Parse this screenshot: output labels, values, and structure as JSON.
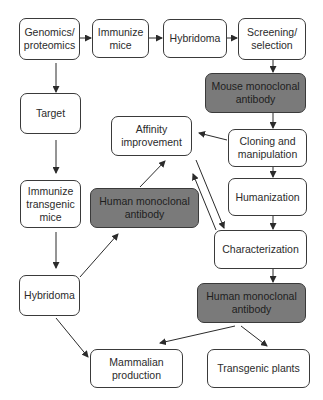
{
  "diagram": {
    "type": "flowchart",
    "colors": {
      "node_fill": "#ffffff",
      "highlight_fill": "#7a7a7a",
      "stroke": "#3a3a3a",
      "text": "#2b2b2b"
    },
    "nodes": {
      "genomics": "Genomics/ proteomics",
      "immunize_mice": "Immunize mice",
      "hybridoma_top": "Hybridoma",
      "screening": "Screening/ selection",
      "mouse_mab": "Mouse monoclonal antibody",
      "target": "Target",
      "affinity": "Affinity improvement",
      "cloning": "Cloning and manipulation",
      "immunize_transgenic": "Immunize transgenic mice",
      "human_mab_mid": "Human monoclonal antibody",
      "humanization": "Humanization",
      "characterization": "Characterization",
      "hybridoma_left": "Hybridoma",
      "human_mab_bottom": "Human monoclonal antibody",
      "mammalian": "Mammalian production",
      "plants": "Transgenic plants"
    },
    "edges": [
      [
        "genomics",
        "immunize_mice"
      ],
      [
        "immunize_mice",
        "hybridoma_top"
      ],
      [
        "hybridoma_top",
        "screening"
      ],
      [
        "screening",
        "mouse_mab"
      ],
      [
        "mouse_mab",
        "cloning"
      ],
      [
        "cloning",
        "affinity"
      ],
      [
        "cloning",
        "humanization"
      ],
      [
        "humanization",
        "characterization"
      ],
      [
        "affinity",
        "characterization"
      ],
      [
        "characterization",
        "affinity"
      ],
      [
        "characterization",
        "human_mab_bottom"
      ],
      [
        "human_mab_bottom",
        "mammalian"
      ],
      [
        "human_mab_bottom",
        "plants"
      ],
      [
        "genomics",
        "target"
      ],
      [
        "target",
        "immunize_transgenic"
      ],
      [
        "immunize_transgenic",
        "hybridoma_left"
      ],
      [
        "hybridoma_left",
        "human_mab_mid"
      ],
      [
        "human_mab_mid",
        "affinity"
      ],
      [
        "hybridoma_left",
        "mammalian"
      ]
    ]
  }
}
